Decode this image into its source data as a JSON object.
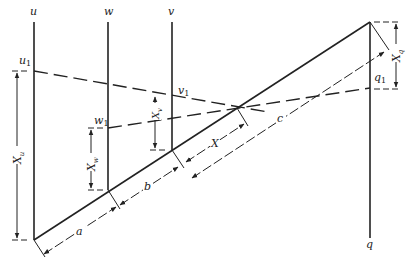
{
  "diagram": {
    "type": "nomogram",
    "scales": [
      {
        "name": "u",
        "label": "u",
        "point": "u",
        "point_sub": "1"
      },
      {
        "name": "w",
        "label": "w",
        "point": "w",
        "point_sub": "1"
      },
      {
        "name": "v",
        "label": "v",
        "point": "v",
        "point_sub": "1"
      },
      {
        "name": "q",
        "label": "q",
        "point": "q",
        "point_sub": "1"
      }
    ],
    "dimensions": {
      "X_u": {
        "base": "X",
        "sub": "u"
      },
      "X_w": {
        "base": "X",
        "sub": "w"
      },
      "X_v": {
        "base": "X",
        "sub": "v"
      },
      "X_q": {
        "base": "X",
        "sub": "q"
      },
      "X": "X",
      "a": "a",
      "b": "b",
      "c": "c"
    }
  }
}
